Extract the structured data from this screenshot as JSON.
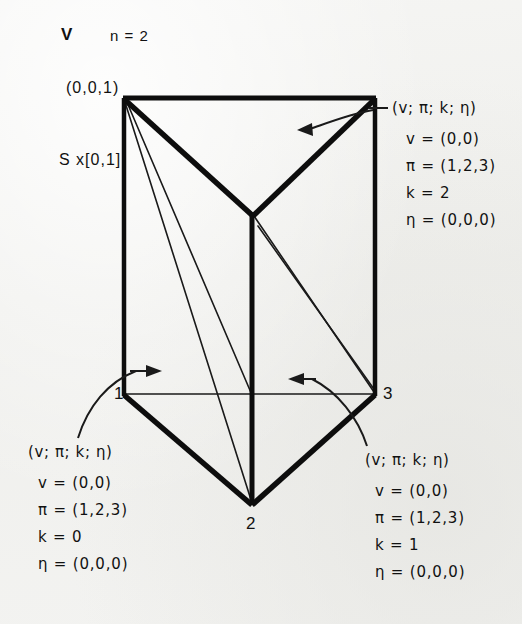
{
  "figure": {
    "symbol": "V",
    "dimension_label": "n = 2",
    "space_label": "S x[0,1]",
    "apex_coordinate": "(0,0,1)",
    "background_color": "#f2f2f0",
    "ink_color": "#111111"
  },
  "vertices": [
    {
      "name": "vertex-1",
      "label": "1"
    },
    {
      "name": "vertex-2",
      "label": "2"
    },
    {
      "name": "vertex-3",
      "label": "3"
    }
  ],
  "annotations": [
    {
      "id": "top-right",
      "header": "(v; π; k; η)",
      "lines": [
        "v = (0,0)",
        "π = (1,2,3)",
        "k = 2",
        "η = (0,0,0)"
      ]
    },
    {
      "id": "bottom-left",
      "header": "(v; π; k; η)",
      "lines": [
        "v = (0,0)",
        "π = (1,2,3)",
        "k = 0",
        "η = (0,0,0)"
      ]
    },
    {
      "id": "bottom-right",
      "header": "(v; π; k; η)",
      "lines": [
        "v = (0,0)",
        "π = (1,2,3)",
        "k = 1",
        "η = (0,0,0)"
      ]
    }
  ]
}
